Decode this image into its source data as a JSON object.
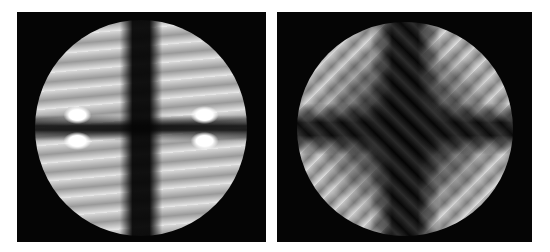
{
  "figure": {
    "panels": [
      {
        "id": "left",
        "description": "Circular grayscale interference pattern with dark vertical and horizontal cross, bright double lobes near left and right edges"
      },
      {
        "id": "right",
        "description": "Circular grayscale interference pattern with broad dark cross and diagonal bright fringes in four quadrants"
      }
    ],
    "colors": {
      "background": "#ffffff",
      "frame": "#050505"
    }
  }
}
